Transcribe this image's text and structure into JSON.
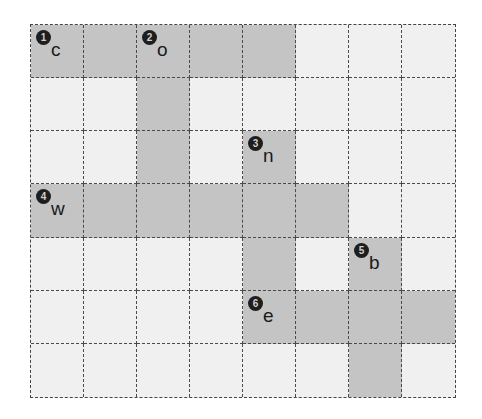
{
  "puzzle": {
    "rows": 7,
    "cols": 8,
    "shaded_cells": [
      [
        0,
        0
      ],
      [
        0,
        1
      ],
      [
        0,
        2
      ],
      [
        0,
        3
      ],
      [
        0,
        4
      ],
      [
        1,
        2
      ],
      [
        2,
        2
      ],
      [
        2,
        4
      ],
      [
        3,
        0
      ],
      [
        3,
        1
      ],
      [
        3,
        2
      ],
      [
        3,
        3
      ],
      [
        3,
        4
      ],
      [
        3,
        5
      ],
      [
        4,
        4
      ],
      [
        4,
        6
      ],
      [
        5,
        4
      ],
      [
        5,
        5
      ],
      [
        5,
        6
      ],
      [
        5,
        7
      ],
      [
        6,
        6
      ]
    ],
    "clues": [
      {
        "number": "1",
        "letter": "c",
        "row": 0,
        "col": 0
      },
      {
        "number": "2",
        "letter": "o",
        "row": 0,
        "col": 2
      },
      {
        "number": "3",
        "letter": "n",
        "row": 2,
        "col": 4
      },
      {
        "number": "4",
        "letter": "w",
        "row": 3,
        "col": 0
      },
      {
        "number": "5",
        "letter": "b",
        "row": 4,
        "col": 6
      },
      {
        "number": "6",
        "letter": "e",
        "row": 5,
        "col": 4
      }
    ]
  },
  "colors": {
    "shaded": "#c4c4c4",
    "empty": "#f0f0f0",
    "grid_line": "#4a4a4a",
    "number_badge": "#1e1e1e"
  }
}
